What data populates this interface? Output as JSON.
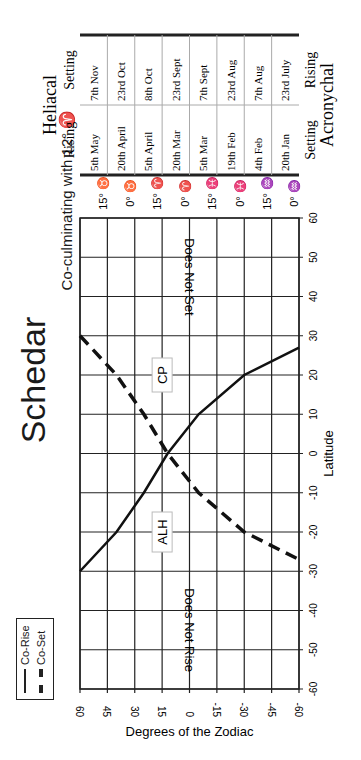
{
  "title": "Schedar",
  "subtitle": "Co-culminating with 12° ♈",
  "legend": {
    "items": [
      {
        "label": "Co-Rise",
        "style": "solid"
      },
      {
        "label": "Co-Set",
        "style": "dashed"
      }
    ]
  },
  "annotations": {
    "top_region": "Does Not Set",
    "bottom_region": "Does Not Rise",
    "cp": "CP",
    "alh": "ALH"
  },
  "zodiac_signs": [
    "15° ♉",
    "0° ♉",
    "15° ♈",
    "0° ♈",
    "15° ♓",
    "0° ♓",
    "15° ♒",
    "0° ♒"
  ],
  "table": {
    "header": "Heliacal",
    "footer": "Acronychal",
    "col1_top": "Rising",
    "col1_bottom": "Setting",
    "col2_top": "Setting",
    "col2_bottom": "Rising",
    "rows": [
      {
        "rising": "5th May",
        "setting": "7th Nov"
      },
      {
        "rising": "20th April",
        "setting": "23rd Oct"
      },
      {
        "rising": "5th April",
        "setting": "8th Oct"
      },
      {
        "rising": "20th Mar",
        "setting": "23rd Sept"
      },
      {
        "rising": "5th Mar",
        "setting": "7th Sept"
      },
      {
        "rising": "19th Feb",
        "setting": "23rd Aug"
      },
      {
        "rising": "4th Feb",
        "setting": "7th Aug"
      },
      {
        "rising": "20th Jan",
        "setting": "23rd July"
      }
    ]
  },
  "chart_data": {
    "type": "line",
    "title": "Schedar",
    "subtitle": "Co-culminating with 12° ♈",
    "xlabel": "Latitude",
    "ylabel": "Degrees of the Zodiac",
    "xlim": [
      -60,
      60
    ],
    "ylim": [
      -60,
      60
    ],
    "xticks": [
      -60,
      -50,
      -40,
      -30,
      -20,
      -10,
      0,
      10,
      20,
      30,
      40,
      50,
      60
    ],
    "yticks": [
      60,
      45,
      30,
      15,
      0,
      -15,
      -30,
      -45,
      -60
    ],
    "grid": true,
    "legend_position": "bottom-left (rotated page)",
    "series": [
      {
        "name": "Co-Rise",
        "style": "solid",
        "x": [
          -30,
          -20,
          -10,
          0,
          10,
          20,
          27
        ],
        "y": [
          60,
          40,
          25,
          12,
          -5,
          -30,
          -60
        ]
      },
      {
        "name": "Co-Set",
        "style": "dashed",
        "x": [
          30,
          20,
          10,
          0,
          -10,
          -20,
          -27
        ],
        "y": [
          60,
          40,
          25,
          12,
          -5,
          -30,
          -60
        ]
      }
    ],
    "annotations": [
      "Does Not Set",
      "Does Not Rise",
      "CP",
      "ALH"
    ]
  }
}
